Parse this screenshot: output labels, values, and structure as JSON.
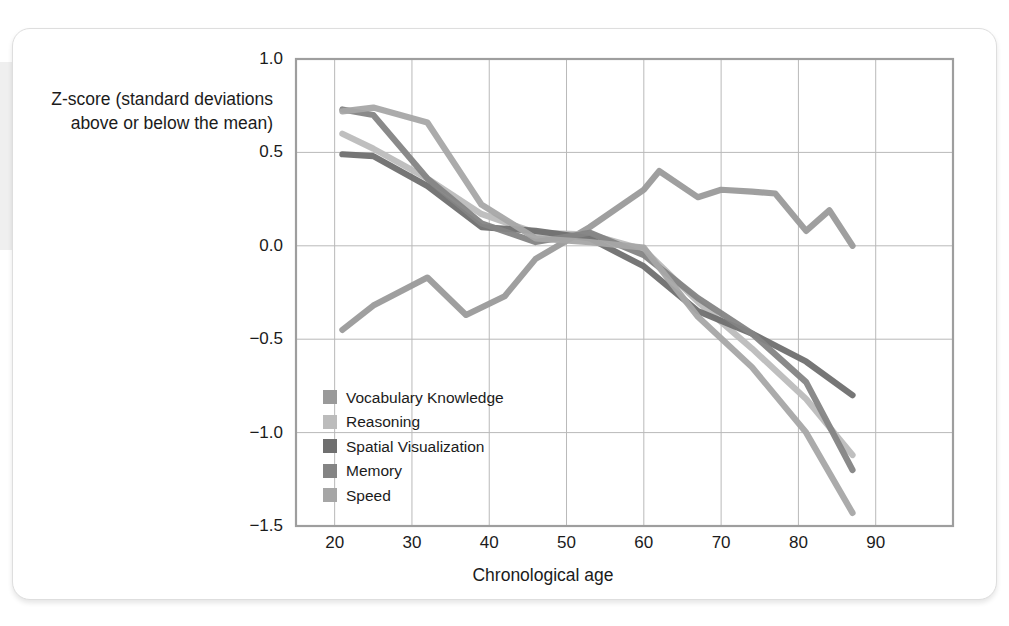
{
  "figure": {
    "axis_label_y": "Z-score (standard deviations above or below the mean)",
    "axis_label_x": "Chronological age"
  },
  "chart_data": {
    "type": "line",
    "title": "",
    "xlabel": "Chronological age",
    "ylabel": "Z-score (standard deviations above or below the mean)",
    "xlim": [
      15,
      100
    ],
    "ylim": [
      -1.5,
      1.0
    ],
    "xticks": [
      20,
      30,
      40,
      50,
      60,
      70,
      80,
      90
    ],
    "yticks": [
      1.0,
      0.5,
      0.0,
      -0.5,
      -1.0,
      -1.5
    ],
    "ytick_labels": [
      "1.0",
      "0.5",
      "0.0",
      "-0.5",
      "-1.0",
      "-1.5"
    ],
    "xtick_labels": [
      "20",
      "30",
      "40",
      "50",
      "60",
      "70",
      "80",
      "90"
    ],
    "grid": true,
    "legend_position": "inside-lower-left",
    "series": [
      {
        "name": "Vocabulary Knowledge",
        "color": "#9a9a9a",
        "x": [
          21,
          25,
          32,
          37,
          42,
          46,
          53,
          60,
          62,
          67,
          70,
          74,
          77,
          81,
          84,
          87
        ],
        "y": [
          -0.45,
          -0.32,
          -0.17,
          -0.37,
          -0.27,
          -0.07,
          0.1,
          0.3,
          0.4,
          0.26,
          0.3,
          0.29,
          0.28,
          0.08,
          0.19,
          0.0
        ]
      },
      {
        "name": "Reasoning",
        "color": "#bcbcbc",
        "x": [
          21,
          25,
          32,
          39,
          46,
          53,
          60,
          67,
          74,
          81,
          87
        ],
        "y": [
          0.6,
          0.52,
          0.36,
          0.17,
          0.07,
          0.06,
          -0.02,
          -0.3,
          -0.55,
          -0.82,
          -1.12
        ]
      },
      {
        "name": "Spatial Visualization",
        "color": "#6f6f6f",
        "x": [
          21,
          25,
          32,
          39,
          46,
          53,
          60,
          67,
          74,
          81,
          87
        ],
        "y": [
          0.49,
          0.48,
          0.32,
          0.1,
          0.08,
          0.04,
          -0.11,
          -0.35,
          -0.47,
          -0.62,
          -0.8
        ]
      },
      {
        "name": "Memory",
        "color": "#848484",
        "x": [
          21,
          25,
          32,
          39,
          46,
          53,
          60,
          67,
          74,
          81,
          87
        ],
        "y": [
          0.73,
          0.7,
          0.36,
          0.12,
          0.02,
          0.07,
          -0.05,
          -0.28,
          -0.47,
          -0.73,
          -1.2
        ]
      },
      {
        "name": "Speed",
        "color": "#a6a6a6",
        "x": [
          21,
          25,
          32,
          39,
          46,
          53,
          60,
          67,
          74,
          81,
          87
        ],
        "y": [
          0.72,
          0.74,
          0.66,
          0.22,
          0.04,
          0.02,
          -0.01,
          -0.38,
          -0.65,
          -1.0,
          -1.43
        ]
      }
    ]
  },
  "legend": {
    "items": [
      {
        "label": "Vocabulary Knowledge",
        "color": "#9a9a9a"
      },
      {
        "label": "Reasoning",
        "color": "#bcbcbc"
      },
      {
        "label": "Spatial Visualization",
        "color": "#6f6f6f"
      },
      {
        "label": "Memory",
        "color": "#848484"
      },
      {
        "label": "Speed",
        "color": "#a6a6a6"
      }
    ]
  },
  "plot_geometry": {
    "left": 283,
    "right": 940,
    "top": 30,
    "bottom": 497
  }
}
